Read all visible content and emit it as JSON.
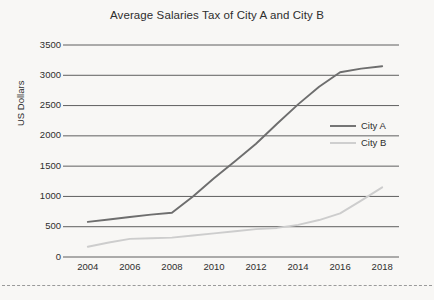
{
  "chart_data": {
    "type": "line",
    "title": "Average Salaries Tax of City A and City B",
    "xlabel": "",
    "ylabel": "US Dollars",
    "x": [
      2004,
      2005,
      2006,
      2007,
      2008,
      2009,
      2010,
      2011,
      2012,
      2013,
      2014,
      2015,
      2016,
      2017,
      2018
    ],
    "xticks": [
      "2004",
      "2006",
      "2008",
      "2010",
      "2012",
      "2014",
      "2016",
      "2018"
    ],
    "xtick_values": [
      2004,
      2006,
      2008,
      2010,
      2012,
      2014,
      2016,
      2018
    ],
    "yticks": [
      "0",
      "500",
      "1000",
      "1500",
      "2000",
      "2500",
      "3000",
      "3500"
    ],
    "ytick_values": [
      0,
      500,
      1000,
      1500,
      2000,
      2500,
      3000,
      3500
    ],
    "ylim": [
      0,
      3500
    ],
    "xlim": [
      2003.2,
      2018.8
    ],
    "grid": "horizontal",
    "legend_position": "center-right",
    "series": [
      {
        "name": "City A",
        "color": "#6e6e6e",
        "values": [
          580,
          620,
          660,
          700,
          730,
          1000,
          1300,
          1580,
          1870,
          2200,
          2520,
          2810,
          3050,
          3110,
          3150
        ]
      },
      {
        "name": "City B",
        "color": "#cdcdcd",
        "values": [
          170,
          240,
          300,
          310,
          320,
          355,
          390,
          425,
          460,
          480,
          530,
          610,
          720,
          930,
          1150
        ]
      }
    ]
  },
  "legend": {
    "entries": [
      {
        "label": "City A"
      },
      {
        "label": "City B"
      }
    ]
  },
  "colors": {
    "background": "#f8f7f5",
    "grid": "#5f5f5f",
    "text": "#2e2e2e",
    "series_a": "#6e6e6e",
    "series_b": "#cdcdcd",
    "bottom_rule": "#9a9a9a"
  }
}
